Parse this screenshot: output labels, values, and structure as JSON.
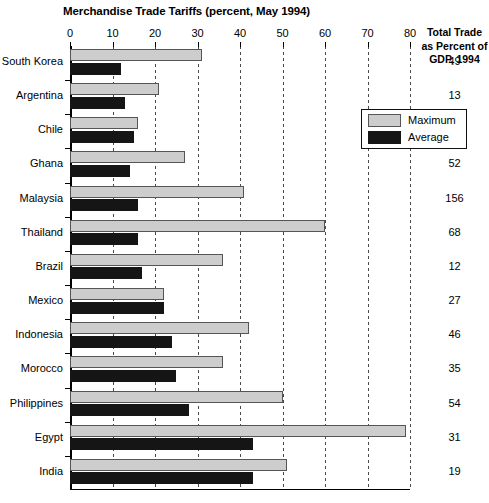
{
  "chart_data": {
    "type": "bar",
    "orientation": "horizontal",
    "title": "Merchandise Trade Tariffs (percent, May 1994)",
    "xlabel": "",
    "ylabel": "",
    "xlim": [
      0,
      80
    ],
    "xticks": [
      0,
      10,
      20,
      30,
      40,
      50,
      60,
      70,
      80
    ],
    "grid": "vertical-dotted",
    "legend_position": "upper-right-inside",
    "categories": [
      "South Korea",
      "Argentina",
      "Chile",
      "Ghana",
      "Malaysia",
      "Thailand",
      "Brazil",
      "Mexico",
      "Indonesia",
      "Morocco",
      "Philippines",
      "Egypt",
      "India"
    ],
    "series": [
      {
        "name": "Maximum",
        "color": "#cdcdcd",
        "values": [
          31,
          21,
          16,
          27,
          41,
          60,
          36,
          22,
          42,
          36,
          50,
          79,
          51
        ]
      },
      {
        "name": "Average",
        "color": "#151515",
        "values": [
          12,
          13,
          15,
          14,
          16,
          16,
          17,
          22,
          24,
          25,
          28,
          43,
          43
        ]
      }
    ],
    "side_column": {
      "header_lines": [
        "Total Trade",
        "as Percent of",
        "GDP, 1994"
      ],
      "values": [
        49,
        13,
        43,
        52,
        156,
        68,
        12,
        27,
        46,
        35,
        54,
        31,
        19
      ]
    }
  }
}
